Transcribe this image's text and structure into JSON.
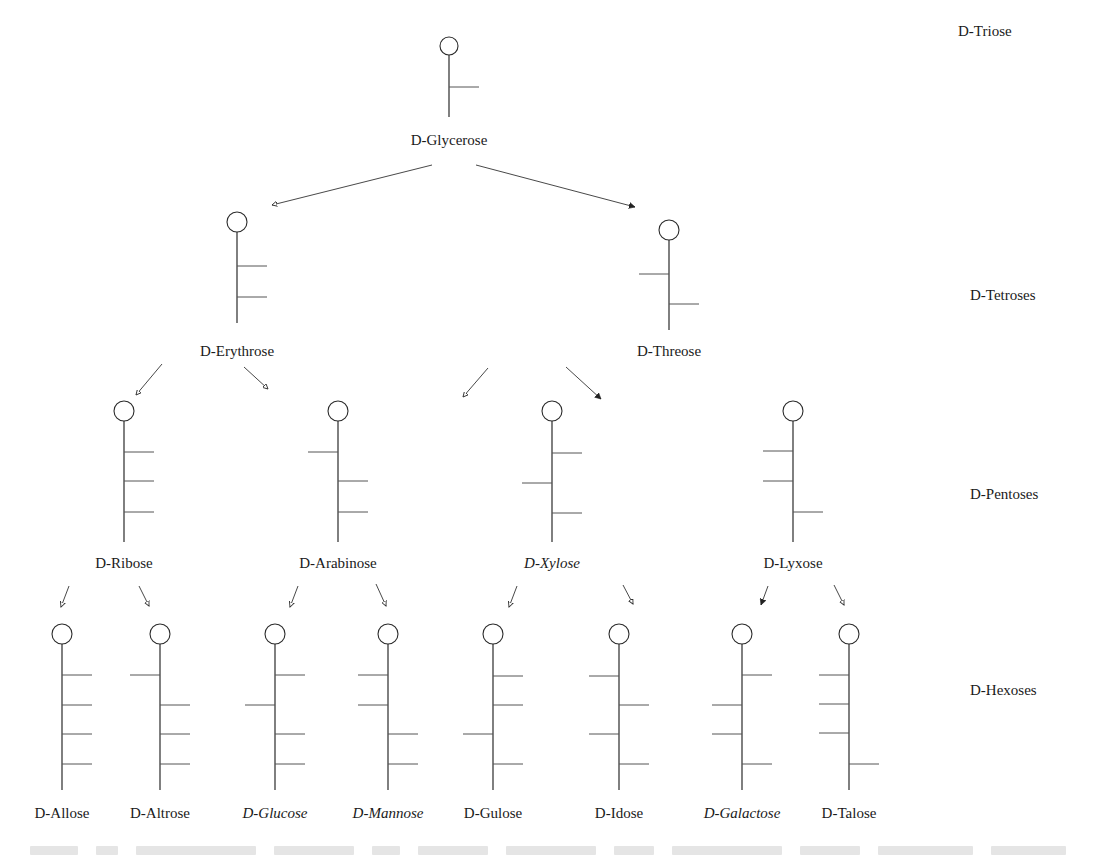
{
  "levels": [
    {
      "id": "triose",
      "label": "D-Triose",
      "x": 958,
      "y": 36
    },
    {
      "id": "tetrose",
      "label": "D-Tetroses",
      "x": 970,
      "y": 300
    },
    {
      "id": "pentose",
      "label": "D-Pentoses",
      "x": 970,
      "y": 499
    },
    {
      "id": "hexose",
      "label": "D-Hexoses",
      "x": 970,
      "y": 695
    }
  ],
  "molecules": [
    {
      "id": "glycerose",
      "name": "D-Glycerose",
      "italic": false,
      "x": 449,
      "cy": 46,
      "r": 9,
      "stem_end": 117,
      "label_y": 145,
      "branches": [
        {
          "y": 87,
          "side": "R"
        }
      ]
    },
    {
      "id": "erythrose",
      "name": "D-Erythrose",
      "italic": false,
      "x": 237,
      "cy": 222,
      "r": 10,
      "stem_end": 323,
      "label_y": 356,
      "branches": [
        {
          "y": 266,
          "side": "R"
        },
        {
          "y": 297,
          "side": "R"
        }
      ]
    },
    {
      "id": "threose",
      "name": "D-Threose",
      "italic": false,
      "x": 669,
      "cy": 230,
      "r": 10,
      "stem_end": 330,
      "label_y": 356,
      "branches": [
        {
          "y": 274,
          "side": "L"
        },
        {
          "y": 304,
          "side": "R"
        }
      ]
    },
    {
      "id": "ribose",
      "name": "D-Ribose",
      "italic": false,
      "x": 124,
      "cy": 411,
      "r": 10,
      "stem_end": 542,
      "label_y": 568,
      "branches": [
        {
          "y": 452,
          "side": "R"
        },
        {
          "y": 481,
          "side": "R"
        },
        {
          "y": 512,
          "side": "R"
        }
      ]
    },
    {
      "id": "arabinose",
      "name": "D-Arabinose",
      "italic": false,
      "x": 338,
      "cy": 411,
      "r": 10,
      "stem_end": 542,
      "label_y": 568,
      "branches": [
        {
          "y": 452,
          "side": "L"
        },
        {
          "y": 481,
          "side": "R"
        },
        {
          "y": 512,
          "side": "R"
        }
      ]
    },
    {
      "id": "xylose",
      "name": "D-Xylose",
      "italic": true,
      "x": 552,
      "cy": 411,
      "r": 10,
      "stem_end": 542,
      "label_y": 568,
      "branches": [
        {
          "y": 453,
          "side": "R"
        },
        {
          "y": 483,
          "side": "L"
        },
        {
          "y": 513,
          "side": "R"
        }
      ]
    },
    {
      "id": "lyxose",
      "name": "D-Lyxose",
      "italic": false,
      "x": 793,
      "cy": 411,
      "r": 10,
      "stem_end": 542,
      "label_y": 568,
      "branches": [
        {
          "y": 451,
          "side": "L"
        },
        {
          "y": 481,
          "side": "L"
        },
        {
          "y": 512,
          "side": "R"
        }
      ]
    },
    {
      "id": "allose",
      "name": "D-Allose",
      "italic": false,
      "x": 62,
      "cy": 634,
      "r": 10,
      "stem_end": 790,
      "label_y": 818,
      "branches": [
        {
          "y": 675,
          "side": "R"
        },
        {
          "y": 705,
          "side": "R"
        },
        {
          "y": 734,
          "side": "R"
        },
        {
          "y": 764,
          "side": "R"
        }
      ]
    },
    {
      "id": "altrose",
      "name": "D-Altrose",
      "italic": false,
      "x": 160,
      "cy": 634,
      "r": 10,
      "stem_end": 790,
      "label_y": 818,
      "branches": [
        {
          "y": 675,
          "side": "L"
        },
        {
          "y": 705,
          "side": "R"
        },
        {
          "y": 734,
          "side": "R"
        },
        {
          "y": 764,
          "side": "R"
        }
      ]
    },
    {
      "id": "glucose",
      "name": "D-Glucose",
      "italic": true,
      "x": 275,
      "cy": 634,
      "r": 10,
      "stem_end": 790,
      "label_y": 818,
      "branches": [
        {
          "y": 675,
          "side": "R"
        },
        {
          "y": 705,
          "side": "L"
        },
        {
          "y": 734,
          "side": "R"
        },
        {
          "y": 764,
          "side": "R"
        }
      ]
    },
    {
      "id": "mannose",
      "name": "D-Mannose",
      "italic": true,
      "x": 388,
      "cy": 634,
      "r": 10,
      "stem_end": 790,
      "label_y": 818,
      "branches": [
        {
          "y": 675,
          "side": "L"
        },
        {
          "y": 705,
          "side": "L"
        },
        {
          "y": 734,
          "side": "R"
        },
        {
          "y": 764,
          "side": "R"
        }
      ]
    },
    {
      "id": "gulose",
      "name": "D-Gulose",
      "italic": false,
      "x": 493,
      "cy": 634,
      "r": 10,
      "stem_end": 790,
      "label_y": 818,
      "branches": [
        {
          "y": 676,
          "side": "R"
        },
        {
          "y": 705,
          "side": "R"
        },
        {
          "y": 734,
          "side": "L"
        },
        {
          "y": 764,
          "side": "R"
        }
      ]
    },
    {
      "id": "idose",
      "name": "D-Idose",
      "italic": false,
      "x": 619,
      "cy": 634,
      "r": 10,
      "stem_end": 790,
      "label_y": 818,
      "branches": [
        {
          "y": 676,
          "side": "L"
        },
        {
          "y": 705,
          "side": "R"
        },
        {
          "y": 734,
          "side": "L"
        },
        {
          "y": 764,
          "side": "R"
        }
      ]
    },
    {
      "id": "galactose",
      "name": "D-Galactose",
      "italic": true,
      "x": 742,
      "cy": 634,
      "r": 10,
      "stem_end": 790,
      "label_y": 818,
      "branches": [
        {
          "y": 675,
          "side": "R"
        },
        {
          "y": 705,
          "side": "L"
        },
        {
          "y": 734,
          "side": "L"
        },
        {
          "y": 764,
          "side": "R"
        }
      ]
    },
    {
      "id": "talose",
      "name": "D-Talose",
      "italic": false,
      "x": 849,
      "cy": 634,
      "r": 10,
      "stem_end": 790,
      "label_y": 818,
      "branches": [
        {
          "y": 675,
          "side": "L"
        },
        {
          "y": 704,
          "side": "L"
        },
        {
          "y": 733,
          "side": "L"
        },
        {
          "y": 764,
          "side": "R"
        }
      ]
    }
  ],
  "arrows": [
    {
      "from": "glycerose",
      "to": "erythrose",
      "x1": 432,
      "y1": 165,
      "x2": 272,
      "y2": 205,
      "head": "open"
    },
    {
      "from": "glycerose",
      "to": "threose",
      "x1": 476,
      "y1": 165,
      "x2": 635,
      "y2": 207,
      "head": "filled"
    },
    {
      "from": "erythrose",
      "to": "ribose",
      "x1": 162,
      "y1": 364,
      "x2": 136,
      "y2": 395,
      "head": "open"
    },
    {
      "from": "erythrose",
      "to": "arabinose",
      "x1": 244,
      "y1": 367,
      "x2": 268,
      "y2": 389,
      "head": "open"
    },
    {
      "from": "threose",
      "to": "xylose",
      "x1": 488,
      "y1": 368,
      "x2": 463,
      "y2": 397,
      "head": "open"
    },
    {
      "from": "threose",
      "to": "lyxose",
      "x1": 566,
      "y1": 367,
      "x2": 601,
      "y2": 399,
      "head": "filled"
    },
    {
      "from": "ribose",
      "to": "allose",
      "x1": 69,
      "y1": 586,
      "x2": 61,
      "y2": 607,
      "head": "open"
    },
    {
      "from": "ribose",
      "to": "altrose",
      "x1": 139,
      "y1": 586,
      "x2": 149,
      "y2": 606,
      "head": "open"
    },
    {
      "from": "arabinose",
      "to": "glucose",
      "x1": 298,
      "y1": 586,
      "x2": 290,
      "y2": 607,
      "head": "open"
    },
    {
      "from": "arabinose",
      "to": "mannose",
      "x1": 376,
      "y1": 584,
      "x2": 386,
      "y2": 606,
      "head": "open"
    },
    {
      "from": "xylose",
      "to": "gulose",
      "x1": 517,
      "y1": 586,
      "x2": 509,
      "y2": 607,
      "head": "open"
    },
    {
      "from": "xylose",
      "to": "idose",
      "x1": 623,
      "y1": 585,
      "x2": 633,
      "y2": 604,
      "head": "open"
    },
    {
      "from": "lyxose",
      "to": "galactose",
      "x1": 768,
      "y1": 586,
      "x2": 761,
      "y2": 605,
      "head": "filled"
    },
    {
      "from": "lyxose",
      "to": "talose",
      "x1": 834,
      "y1": 585,
      "x2": 844,
      "y2": 605,
      "head": "open"
    }
  ],
  "style": {
    "branch_length": 30,
    "colors": {
      "ink": "#2a2a2a",
      "text": "#1a1a1a",
      "background": "#ffffff"
    }
  }
}
